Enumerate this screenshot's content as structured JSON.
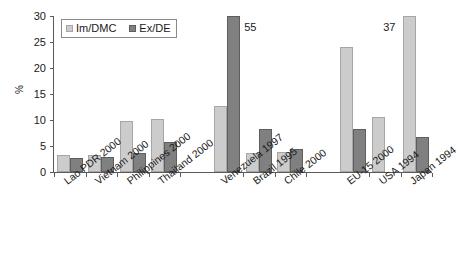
{
  "chart_data": {
    "type": "bar",
    "title": "",
    "xlabel": "",
    "ylabel": "%",
    "ylim": [
      0,
      30
    ],
    "yticks": [
      0,
      5,
      10,
      15,
      20,
      25,
      30
    ],
    "grid": false,
    "legend_position": "top-left",
    "axis_note": "Bars exceeding the 30% axis maximum are clipped and annotated with their true value.",
    "categories": [
      "Lao PDR 2000",
      "Vietnam 2000",
      "Philippines 2000",
      "Thailand 2000",
      "Venezuela 1997",
      "Brazil 1995",
      "Chile 2000",
      "EU-15 2000",
      "USA 1994",
      "Japan 1994"
    ],
    "series": [
      {
        "name": "Im/DMC",
        "color": "#cccccc",
        "values": [
          3.2,
          3.3,
          9.8,
          10.1,
          12.7,
          3.7,
          3.9,
          24.0,
          10.6,
          37.0
        ]
      },
      {
        "name": "Ex/DE",
        "color": "#808080",
        "values": [
          2.7,
          2.9,
          3.7,
          5.7,
          55.0,
          8.3,
          4.5,
          8.3,
          null,
          6.8
        ]
      }
    ],
    "annotations": [
      {
        "text": "55",
        "series": "Ex/DE",
        "category": "Venezuela 1997",
        "true_value": 55
      },
      {
        "text": "37",
        "series": "Im/DMC",
        "category": "Japan 1994",
        "true_value": 37
      }
    ],
    "groups": [
      {
        "name": "Southeast Asia",
        "categories": [
          "Lao PDR 2000",
          "Vietnam 2000",
          "Philippines 2000",
          "Thailand 2000"
        ]
      },
      {
        "name": "Latin America",
        "categories": [
          "Venezuela 1997",
          "Brazil 1995",
          "Chile 2000"
        ]
      },
      {
        "name": "Industrialised",
        "categories": [
          "EU-15 2000",
          "USA 1994",
          "Japan 1994"
        ]
      }
    ]
  },
  "legend": {
    "items": [
      {
        "label": "Im/DMC",
        "swatch": "light-gray-square"
      },
      {
        "label": "Ex/DE",
        "swatch": "dark-gray-square"
      }
    ]
  }
}
